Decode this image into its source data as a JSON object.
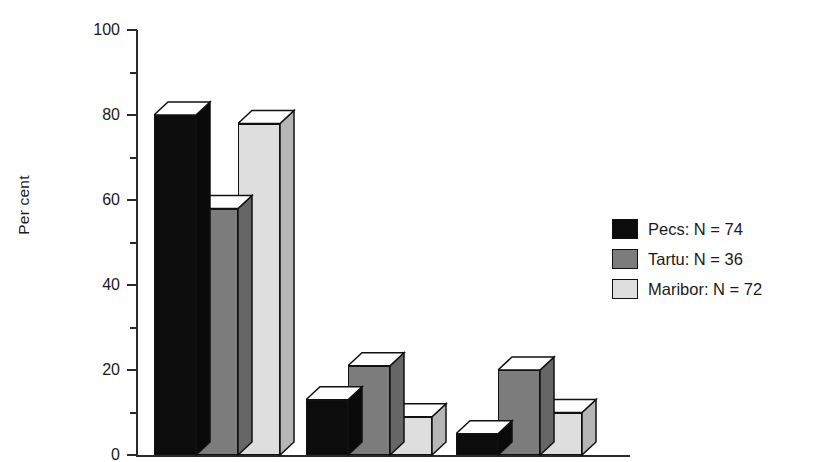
{
  "chart_data": {
    "type": "bar",
    "title": "",
    "subtitle": "",
    "xlabel": "",
    "ylabel": "Per cent",
    "ylim": [
      0,
      100
    ],
    "ytick_values": [
      0,
      20,
      40,
      60,
      80,
      100
    ],
    "ytick_labels": [
      "0",
      "20",
      "40",
      "60",
      "80",
      "100"
    ],
    "yminor_tick_values": [
      10,
      30,
      50,
      70,
      90
    ],
    "grid": false,
    "legend_position": "right",
    "style": "3d-bars",
    "categories": [
      "",
      "",
      ""
    ],
    "series": [
      {
        "name": "Pecs: N = 74",
        "color": "#0c0c0c",
        "values": [
          80,
          13,
          5
        ]
      },
      {
        "name": "Tartu: N = 36",
        "color": "#7c7c7c",
        "values": [
          58,
          21,
          20
        ]
      },
      {
        "name": "Maribor: N = 72",
        "color": "#dedede",
        "values": [
          78,
          9,
          10
        ]
      }
    ],
    "annotations": []
  },
  "axes": {
    "y_label": "Per cent",
    "ticks": [
      {
        "value": 100,
        "label": "100"
      },
      {
        "value": 90,
        "label": ""
      },
      {
        "value": 80,
        "label": "80"
      },
      {
        "value": 70,
        "label": ""
      },
      {
        "value": 60,
        "label": "60"
      },
      {
        "value": 50,
        "label": ""
      },
      {
        "value": 40,
        "label": "40"
      },
      {
        "value": 30,
        "label": ""
      },
      {
        "value": 20,
        "label": "20"
      },
      {
        "value": 10,
        "label": ""
      },
      {
        "value": 0,
        "label": "0"
      }
    ]
  },
  "legend": {
    "items": [
      {
        "label": "Pecs: N = 74",
        "color": "#0c0c0c"
      },
      {
        "label": "Tartu: N = 36",
        "color": "#7c7c7c"
      },
      {
        "label": "Maribor: N = 72",
        "color": "#dedede"
      }
    ]
  },
  "colors": {
    "series_1": "#0c0c0c",
    "series_2": "#7c7c7c",
    "series_3": "#dedede",
    "outline": "#111111",
    "axis": "#2a2a2a",
    "top_face": "#ffffff",
    "background": "#ffffff"
  }
}
